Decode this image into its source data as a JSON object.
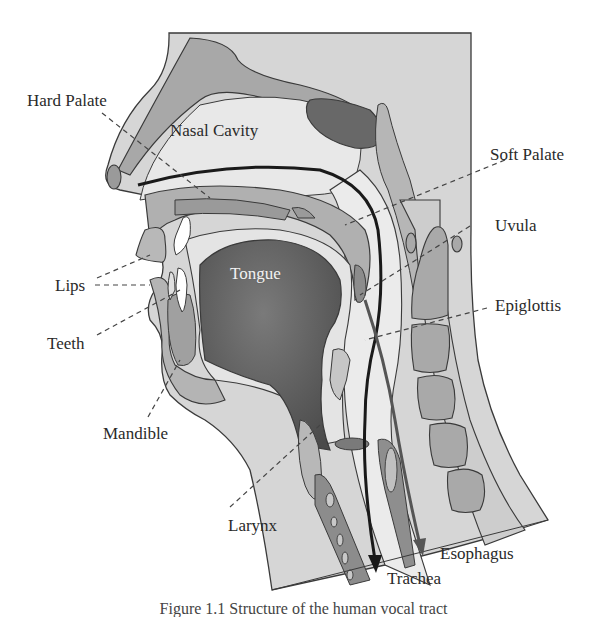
{
  "figure": {
    "caption": "Figure 1.1  Structure of the human vocal tract"
  },
  "labels": {
    "hard_palate": "Hard Palate",
    "nasal_cavity": "Nasal Cavity",
    "soft_palate": "Soft Palate",
    "uvula": "Uvula",
    "lips": "Lips",
    "tongue": "Tongue",
    "teeth": "Teeth",
    "epiglottis": "Epiglottis",
    "mandible": "Mandible",
    "larynx": "Larynx",
    "esophagus": "Esophagus",
    "trachea": "Trachea"
  },
  "colors": {
    "background": "#ffffff",
    "skin": "#d9d9d9",
    "tissue_light": "#e6e6e6",
    "tissue_mid": "#b8b8b8",
    "tissue_dark": "#8e8e8e",
    "tongue": "#5e5e5e",
    "sinus": "#6a6a6a",
    "teeth": "#ffffff",
    "outline": "#3a3a3a",
    "air_arrow": "#1a1a1a",
    "food_arrow": "#555555"
  }
}
